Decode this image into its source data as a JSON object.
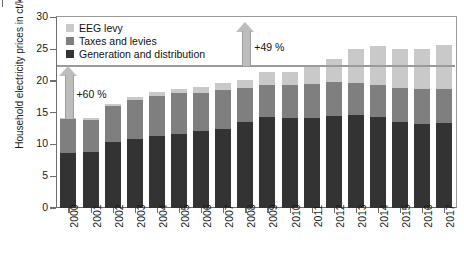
{
  "axis": {
    "ylabel": "Household electricity prices in ct/kWh",
    "yticks": [
      "0",
      "5",
      "10",
      "15",
      "20",
      "25",
      "30"
    ]
  },
  "legend": {
    "items": [
      {
        "label": "EEG levy",
        "color": "#c9c9c9",
        "key": "eeg"
      },
      {
        "label": "Taxes and levies",
        "color": "#7f7f7f",
        "key": "tax"
      },
      {
        "label": "Generation and distribution",
        "color": "#333333",
        "key": "gen"
      }
    ]
  },
  "annotations": [
    {
      "label": "+60 %",
      "from": 14.0,
      "to": 22.3,
      "at_year": "2000"
    },
    {
      "label": "+49 %",
      "from": 22.3,
      "to": 29.2,
      "at_year": "2008"
    }
  ],
  "chart_data": {
    "type": "bar",
    "title": "",
    "subtitle": "",
    "xlabel": "",
    "ylabel": "Household electricity prices in ct/kWh",
    "ylim": [
      0,
      30
    ],
    "ytick_step": 5,
    "grid": false,
    "stacked": true,
    "legend_position": "top-left",
    "categories": [
      "2000",
      "2001",
      "2002",
      "2003",
      "2004",
      "2005",
      "2006",
      "2007",
      "2008",
      "2009",
      "2010",
      "2011",
      "2012",
      "2013",
      "2014",
      "2015",
      "2016",
      "2017"
    ],
    "series": [
      {
        "name": "Generation and distribution",
        "color": "#333333",
        "values": [
          8.6,
          8.8,
          10.4,
          10.9,
          11.4,
          11.7,
          12.1,
          12.5,
          13.5,
          14.4,
          14.2,
          14.2,
          14.5,
          14.6,
          14.3,
          13.6,
          13.3,
          13.4
        ]
      },
      {
        "name": "Taxes and levies",
        "color": "#7f7f7f",
        "values": [
          5.4,
          5.0,
          5.6,
          6.1,
          6.3,
          6.4,
          6.0,
          6.1,
          5.4,
          5.0,
          5.1,
          5.3,
          5.3,
          5.1,
          5.0,
          5.3,
          5.4,
          5.3
        ]
      },
      {
        "name": "EEG levy",
        "color": "#c9c9c9",
        "values": [
          0.2,
          0.4,
          0.4,
          0.5,
          0.6,
          0.7,
          0.9,
          1.0,
          1.2,
          2.0,
          2.1,
          3.6,
          3.6,
          5.3,
          6.2,
          6.2,
          6.4,
          6.9
        ]
      }
    ],
    "totals": [
      14.2,
      14.2,
      16.4,
      17.5,
      18.3,
      18.8,
      19.0,
      19.6,
      20.1,
      21.4,
      21.4,
      23.1,
      23.4,
      25.0,
      25.5,
      25.1,
      25.1,
      25.6
    ],
    "annotations": [
      {
        "text": "+60 %",
        "type": "arrow",
        "from_value": 14.0,
        "to_value": 22.3
      },
      {
        "text": "+49 %",
        "type": "arrow",
        "from_value": 22.3,
        "to_value": 29.2
      }
    ]
  }
}
